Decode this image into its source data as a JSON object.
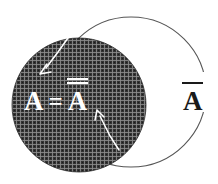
{
  "figure": {
    "background_color": "#ffffff"
  },
  "shaded_set": {
    "name": "set-a-disc",
    "fill_color": "#3c3c3c",
    "texture": "crosshatch-halftone",
    "center": {
      "x": 79,
      "y": 105
    },
    "radius": 67
  },
  "outline_set": {
    "name": "complement-circle",
    "stroke_color": "#555555",
    "stroke_width": 1.1,
    "center": {
      "x": 131,
      "y": 92
    },
    "radius": 75
  },
  "labels": {
    "inner": {
      "left_operand": "A",
      "relation": "=",
      "right_operand": "A",
      "right_operand_bars": 2,
      "full_text": "A = A̅̅",
      "color": "#ffffff"
    },
    "outer": {
      "operand": "A",
      "operand_bars": 1,
      "full_text": "A̅",
      "color": "#1a1a1a"
    }
  },
  "leader_arrows": [
    {
      "name": "leader-arrow-upper",
      "color": "#ffffff",
      "from": {
        "x": 66,
        "y": 40
      },
      "to": {
        "x": 42,
        "y": 72
      },
      "description": "points from the outline circle boundary down-left into the shaded disc"
    },
    {
      "name": "leader-arrow-lower",
      "color": "#ffffff",
      "from": {
        "x": 117,
        "y": 147
      },
      "to": {
        "x": 99,
        "y": 112
      },
      "description": "points up-left from the disc edge toward the double-barred A"
    }
  ]
}
